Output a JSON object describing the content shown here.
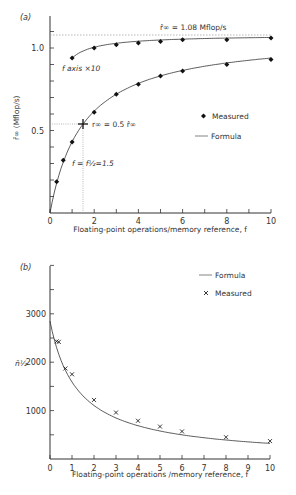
{
  "chart_data": [
    {
      "type": "line",
      "panel_label": "(a)",
      "title": "",
      "xlabel": "Floating-point operations/memory reference, f",
      "ylabel": "r̄∞ (Mflop/s)",
      "xlim": [
        0,
        10
      ],
      "ylim": [
        0,
        1.15
      ],
      "x_ticks": [
        "0",
        "2",
        "4",
        "6",
        "8",
        "10"
      ],
      "y_ticks": [
        "0.5",
        "1.0"
      ],
      "legend": [
        {
          "marker": "filled-diamond",
          "label": "Measured"
        },
        {
          "marker": "line",
          "label": "Formula"
        }
      ],
      "legend_position": "right-center",
      "annotations": {
        "asymptote": "r̂∞ = 1.08 Mflop/s",
        "half_point": "r∞ = 0.5 r̂∞",
        "half_f": "f = f1/2 = 1.5",
        "upper_curve_note": "f axis ×10"
      },
      "asymptote_value": 1.08,
      "f_half": 1.5,
      "series": [
        {
          "name": "Measured",
          "x": [
            0.3,
            0.6,
            1,
            2,
            3,
            4,
            5,
            6,
            8,
            10
          ],
          "values": [
            0.19,
            0.32,
            0.43,
            0.61,
            0.72,
            0.78,
            0.83,
            0.86,
            0.9,
            0.93
          ]
        },
        {
          "name": "Measured (f axis ×10)",
          "x": [
            1,
            2,
            3,
            4,
            5,
            6,
            8,
            10
          ],
          "values": [
            0.94,
            1.0,
            1.02,
            1.03,
            1.04,
            1.05,
            1.05,
            1.06
          ]
        },
        {
          "name": "Formula",
          "expression": "1.08*f/(f+1.5)"
        }
      ],
      "half_marker": {
        "x": 1.5,
        "y": 0.54
      }
    },
    {
      "type": "line",
      "panel_label": "(b)",
      "title": "",
      "xlabel": "Floating-point operations /memory reference, f",
      "ylabel": "n̄1/2",
      "xlim": [
        0,
        10
      ],
      "ylim": [
        0,
        4000
      ],
      "x_ticks": [
        "0",
        "1",
        "2",
        "3",
        "4",
        "5",
        "6",
        "7",
        "8",
        "9",
        "10"
      ],
      "y_ticks": [
        "1000",
        "2000",
        "3000"
      ],
      "legend": [
        {
          "marker": "line",
          "label": "Formula"
        },
        {
          "marker": "cross",
          "label": "Measured"
        }
      ],
      "legend_position": "upper-right",
      "series": [
        {
          "name": "Measured",
          "x": [
            0.3,
            0.4,
            0.7,
            1,
            2,
            3,
            4,
            5,
            6,
            8,
            10
          ],
          "values": [
            2430,
            2420,
            1870,
            1750,
            1220,
            960,
            790,
            670,
            570,
            450,
            370
          ]
        },
        {
          "name": "Formula",
          "expression": "2850*1.5/(f+1.5) approx",
          "x": [
            0,
            0.5,
            1,
            2,
            3,
            4,
            5,
            6,
            8,
            10
          ],
          "values": [
            2850,
            2200,
            1750,
            1220,
            960,
            790,
            670,
            570,
            450,
            370
          ]
        }
      ]
    }
  ],
  "labels": {
    "a_panel": "(a)",
    "a_xlabel": "Floating-point operations/memory reference, f",
    "a_ylabel": "r̄∞ (Mflop/s)",
    "a_asym": "r̂∞ = 1.08  Mflop/s",
    "a_half": "r∞ = 0.5  r̂∞",
    "a_fhalf": "f = f½=1.5",
    "a_x10": "f  axis  ×10",
    "a_leg_measured": "Measured",
    "a_leg_formula": "Formula",
    "a_y05": "0.5",
    "a_y10": "1.0",
    "b_panel": "(b)",
    "b_xlabel": "Floating-point operations /memory reference, f",
    "b_ylabel": "n̄½",
    "b_leg_formula": "Formula",
    "b_leg_measured": "Measured",
    "b_y1000": "1000",
    "b_y2000": "2000",
    "b_y3000": "3000"
  }
}
